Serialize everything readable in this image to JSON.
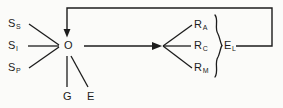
{
  "diagram": {
    "type": "flow-diagram",
    "background_color": "#fbfbf9",
    "line_color": "#1c1c1c",
    "text_color": "#1c1c1c",
    "stimulus_inputs": [
      {
        "id": "s-s",
        "base": "S",
        "subscript": "S"
      },
      {
        "id": "s-i",
        "base": "S",
        "subscript": "I"
      },
      {
        "id": "s-p",
        "base": "S",
        "subscript": "P"
      }
    ],
    "center": {
      "id": "o",
      "base": "O"
    },
    "lower_inputs": [
      {
        "id": "g",
        "base": "G"
      },
      {
        "id": "e-lower",
        "base": "E"
      }
    ],
    "response_outputs": [
      {
        "id": "r-a",
        "base": "R",
        "subscript": "A"
      },
      {
        "id": "r-c",
        "base": "R",
        "subscript": "C"
      },
      {
        "id": "r-m",
        "base": "R",
        "subscript": "M"
      }
    ],
    "grouped_output": {
      "id": "e-l",
      "base": "E",
      "subscript": "L"
    },
    "connectors": {
      "main_arrow": "O to R group",
      "feedback_loop": "E back to O"
    }
  }
}
